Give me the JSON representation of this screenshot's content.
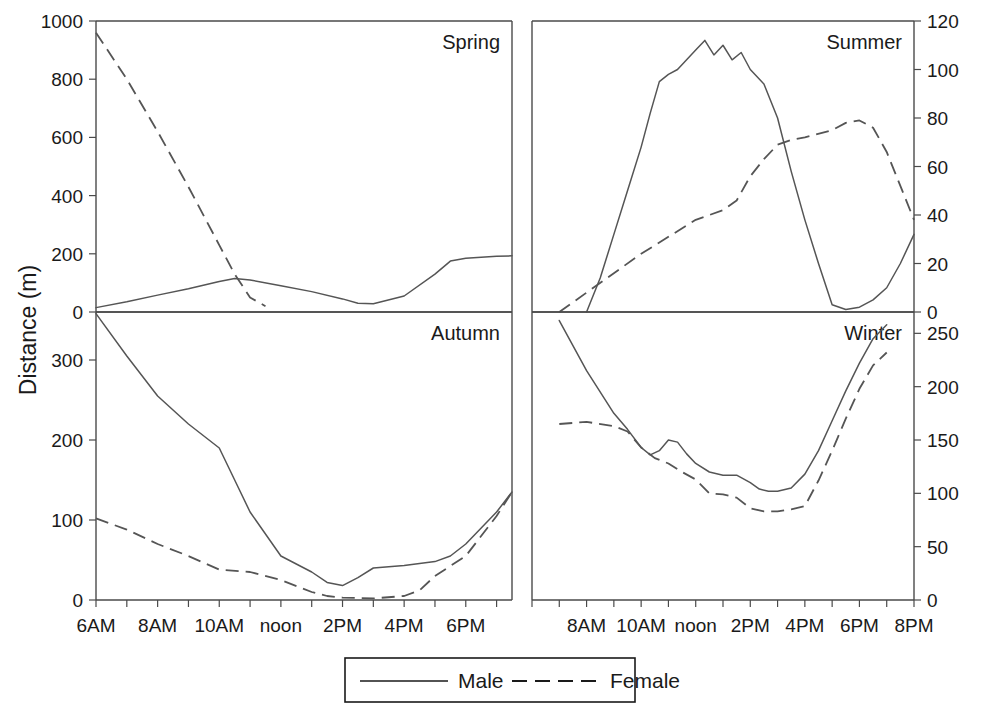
{
  "figure": {
    "y_axis_title": "Distance (m)",
    "background_color": "#ffffff",
    "line_color": "#555555"
  },
  "legend": {
    "entries": [
      {
        "label": "Male",
        "style": "solid"
      },
      {
        "label": "Female",
        "style": "dashed"
      }
    ]
  },
  "chart_data": {
    "type": "line",
    "title": "",
    "xlabel": "",
    "ylabel": "Distance (m)",
    "layout": "2x2 panel grid",
    "grid": false,
    "legend_position": "bottom-center",
    "x_tick_labels_left": [
      "6AM",
      "",
      "8AM",
      "",
      "10AM",
      "",
      "noon",
      "",
      "2PM",
      "",
      "4PM",
      "",
      "6PM",
      ""
    ],
    "x_tick_labels_right": [
      "",
      "",
      "8AM",
      "",
      "10AM",
      "",
      "noon",
      "",
      "2PM",
      "",
      "4PM",
      "",
      "6PM",
      "",
      "8PM"
    ],
    "panels": [
      {
        "name": "Spring",
        "position": "top-left",
        "axis_side": "left",
        "ylim": [
          0,
          1000
        ],
        "yticks": [
          0,
          200,
          400,
          600,
          800,
          1000
        ],
        "xlim": [
          "6AM",
          "7:30PM"
        ],
        "series": [
          {
            "name": "Male",
            "style": "solid",
            "x": [
              "6AM",
              "7AM",
              "8AM",
              "9AM",
              "10AM",
              "10:30AM",
              "11AM",
              "noon",
              "1PM",
              "2PM",
              "2:30PM",
              "3PM",
              "4PM",
              "5PM",
              "5:30PM",
              "6PM",
              "7PM",
              "7:30PM"
            ],
            "y": [
              15,
              35,
              58,
              80,
              105,
              115,
              110,
              90,
              70,
              45,
              30,
              28,
              55,
              130,
              175,
              185,
              192,
              193
            ]
          },
          {
            "name": "Female",
            "style": "dashed",
            "x": [
              "6AM",
              "7AM",
              "8AM",
              "9AM",
              "10AM",
              "10:30AM",
              "11AM",
              "11:30AM"
            ],
            "y": [
              960,
              800,
              620,
              430,
              230,
              130,
              50,
              20
            ]
          }
        ]
      },
      {
        "name": "Summer",
        "position": "top-right",
        "axis_side": "right",
        "ylim": [
          0,
          120
        ],
        "yticks": [
          0,
          20,
          40,
          60,
          80,
          100,
          120
        ],
        "xlim": [
          "6AM",
          "8PM"
        ],
        "series": [
          {
            "name": "Male",
            "style": "solid",
            "x": [
              "8AM",
              "8:30AM",
              "9AM",
              "9:30AM",
              "10AM",
              "10:20AM",
              "10:40AM",
              "11AM",
              "11:20AM",
              "11:40AM",
              "noon",
              "12:20PM",
              "12:40PM",
              "1PM",
              "1:20PM",
              "1:40PM",
              "2PM",
              "2:30PM",
              "3PM",
              "3:30PM",
              "4PM",
              "4:30PM",
              "5PM",
              "5:30PM",
              "6PM",
              "6:30PM",
              "7PM",
              "7:30PM",
              "8PM"
            ],
            "y": [
              0,
              14,
              32,
              50,
              68,
              82,
              95,
              98,
              100,
              104,
              108,
              112,
              106,
              110,
              104,
              107,
              100,
              94,
              80,
              58,
              38,
              20,
              3,
              1,
              2,
              5,
              10,
              20,
              32
            ]
          },
          {
            "name": "Female",
            "style": "dashed",
            "x": [
              "7AM",
              "8AM",
              "9AM",
              "10AM",
              "11AM",
              "noon",
              "1PM",
              "1:30PM",
              "2PM",
              "2:30PM",
              "3PM",
              "3:30PM",
              "4PM",
              "5PM",
              "5:30PM",
              "6PM",
              "6:30PM",
              "7PM",
              "7:30PM",
              "8PM"
            ],
            "y": [
              0,
              8,
              16,
              24,
              31,
              38,
              42,
              46,
              56,
              63,
              69,
              71,
              72,
              75,
              78,
              79,
              76,
              66,
              52,
              38
            ]
          }
        ]
      },
      {
        "name": "Autumn",
        "position": "bottom-left",
        "axis_side": "left",
        "ylim": [
          0,
          360
        ],
        "yticks": [
          0,
          100,
          200,
          300
        ],
        "xlim": [
          "6AM",
          "7:30PM"
        ],
        "series": [
          {
            "name": "Male",
            "style": "solid",
            "x": [
              "6AM",
              "7AM",
              "8AM",
              "9AM",
              "10AM",
              "10:30AM",
              "11AM",
              "noon",
              "1PM",
              "1:30PM",
              "2PM",
              "2:30PM",
              "3PM",
              "4PM",
              "5PM",
              "5:30PM",
              "6PM",
              "7PM",
              "7:30PM"
            ],
            "y": [
              358,
              305,
              255,
              220,
              190,
              150,
              110,
              55,
              35,
              22,
              18,
              28,
              40,
              43,
              48,
              55,
              70,
              110,
              135
            ]
          },
          {
            "name": "Female",
            "style": "dashed",
            "x": [
              "6AM",
              "7AM",
              "8AM",
              "9AM",
              "10AM",
              "11AM",
              "noon",
              "1PM",
              "1:30PM",
              "2PM",
              "3PM",
              "4PM",
              "4:30PM",
              "5PM",
              "6PM",
              "7PM",
              "7:30PM"
            ],
            "y": [
              102,
              88,
              70,
              55,
              38,
              35,
              25,
              10,
              5,
              3,
              2,
              5,
              12,
              30,
              55,
              105,
              135
            ]
          }
        ]
      },
      {
        "name": "Winter",
        "position": "bottom-right",
        "axis_side": "right",
        "ylim": [
          0,
          270
        ],
        "yticks": [
          0,
          50,
          100,
          150,
          200,
          250
        ],
        "xlim": [
          "6AM",
          "8PM"
        ],
        "series": [
          {
            "name": "Male",
            "style": "solid",
            "x": [
              "7AM",
              "8AM",
              "9AM",
              "9:30AM",
              "10AM",
              "10:20AM",
              "10:40AM",
              "11AM",
              "11:20AM",
              "11:40AM",
              "noon",
              "12:30PM",
              "1PM",
              "1:30PM",
              "2PM",
              "2:20PM",
              "2:40PM",
              "3PM",
              "3:30PM",
              "4PM",
              "4:30PM",
              "5PM",
              "5:30PM",
              "6PM",
              "6:30PM",
              "7PM"
            ],
            "y": [
              262,
              215,
              175,
              160,
              143,
              136,
              140,
              150,
              148,
              137,
              128,
              120,
              117,
              117,
              110,
              104,
              102,
              102,
              105,
              118,
              140,
              168,
              196,
              222,
              245,
              258
            ]
          },
          {
            "name": "Female",
            "style": "dashed",
            "x": [
              "7AM",
              "8AM",
              "9AM",
              "9:30AM",
              "10AM",
              "10:30AM",
              "11AM",
              "11:30AM",
              "noon",
              "12:30PM",
              "1PM",
              "1:30PM",
              "2PM",
              "2:30PM",
              "3PM",
              "3:30PM",
              "4PM",
              "4:30PM",
              "5PM",
              "5:30PM",
              "6PM",
              "6:30PM",
              "7PM"
            ],
            "y": [
              165,
              167,
              163,
              158,
              143,
              133,
              128,
              120,
              113,
              100,
              99,
              96,
              86,
              83,
              83,
              85,
              88,
              112,
              140,
              170,
              198,
              220,
              232
            ]
          }
        ]
      }
    ]
  }
}
